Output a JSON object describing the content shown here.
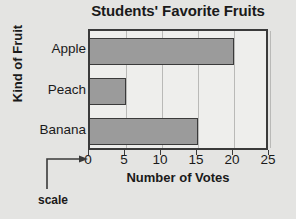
{
  "chart_data": {
    "type": "bar",
    "orientation": "horizontal",
    "title": "Students' Favorite Fruits",
    "xlabel": "Number of Votes",
    "ylabel": "Kind of Fruit",
    "categories": [
      "Apple",
      "Peach",
      "Banana"
    ],
    "values": [
      20,
      5,
      15
    ],
    "xlim": [
      0,
      25
    ],
    "xticks": [
      0,
      5,
      10,
      15,
      20,
      25
    ],
    "xtick_labels": [
      "0",
      "5",
      "10",
      "15",
      "20",
      "25"
    ],
    "grid": true,
    "grid_axis": "x",
    "legend": null,
    "annotations": [
      {
        "text": "scale",
        "points_to": "x-axis-zero-tick"
      }
    ],
    "colors": {
      "bar_fill": "#9b9b9b",
      "bar_edge": "#3a3a3a",
      "plot_background": "#eeeeec",
      "page_background": "#e4e4e2",
      "gridline": "#b9b9b7",
      "text": "#1a1a1a"
    }
  }
}
